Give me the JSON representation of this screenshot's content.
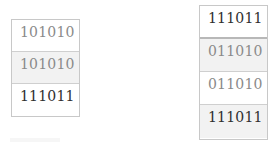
{
  "left_stack": {
    "cells": [
      {
        "value": "101010",
        "shaded": false,
        "tone": "light"
      },
      {
        "value": "101010",
        "shaded": true,
        "tone": "light"
      },
      {
        "value": "111011",
        "shaded": false,
        "tone": "dark"
      }
    ]
  },
  "right_stack": {
    "cells": [
      {
        "value": "111011",
        "shaded": false,
        "tone": "dark"
      },
      {
        "value": "011010",
        "shaded": true,
        "tone": "light"
      },
      {
        "value": "011010",
        "shaded": false,
        "tone": "light"
      },
      {
        "value": "111011",
        "shaded": true,
        "tone": "dark"
      }
    ]
  },
  "colors": {
    "border": "#c8c8c8",
    "shade": "#f2f2f2",
    "text_light": "#8a8a8a",
    "text_dark": "#2e2e2e"
  }
}
